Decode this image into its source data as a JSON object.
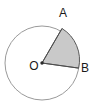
{
  "figure": {
    "kind": "circle-sector-diagram",
    "background_color": "#ffffff",
    "canvas": {
      "width": 96,
      "height": 105
    },
    "circle": {
      "center_label": "O",
      "center_x": 42,
      "center_y": 63,
      "radius": 37,
      "stroke_color": "#9a9a9a",
      "stroke_width": 1,
      "fill_color": "#ffffff"
    },
    "center_dot": {
      "x": 42,
      "y": 63,
      "radius": 1.6,
      "color": "#2b2b2b"
    },
    "sector": {
      "name": "sector-OAB",
      "fill_color": "#c9c9c9",
      "stroke_color": "#5a5a5a",
      "stroke_width": 1,
      "start_point_label": "A",
      "end_point_label": "B",
      "start_angle_deg": 299,
      "end_angle_deg": 8,
      "sweep_deg": 69
    },
    "radii": [
      {
        "name": "radius-OA",
        "from": "O",
        "to": "A",
        "x1": 42,
        "y1": 63,
        "x2": 62,
        "y2": 28
      },
      {
        "name": "radius-OB",
        "from": "O",
        "to": "B",
        "x1": 42,
        "y1": 63,
        "x2": 78,
        "y2": 68
      }
    ],
    "points": [
      {
        "label": "A",
        "point_x": 62,
        "point_y": 28,
        "label_x": 63,
        "label_y": 16
      },
      {
        "label": "B",
        "point_x": 78,
        "point_y": 68,
        "label_x": 84,
        "label_y": 71
      },
      {
        "label": "O",
        "point_x": 42,
        "point_y": 63,
        "label_x": 30,
        "label_y": 69
      }
    ]
  },
  "labels": {
    "point_a": "A",
    "point_b": "B",
    "center_o": "O"
  }
}
